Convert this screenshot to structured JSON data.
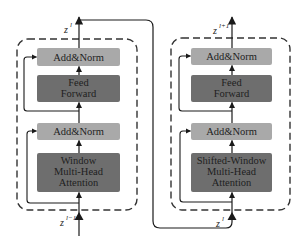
{
  "colors": {
    "light_box": "#a9a9a9",
    "dark_box": "#6e6e6e",
    "line": "#1a1a1a",
    "dashed": "#333333",
    "text": "#1e1e1e"
  },
  "blocks": [
    {
      "name": "swin-block-wmsa",
      "boxes": [
        {
          "label": "Add&Norm",
          "kind": "light"
        },
        {
          "label_lines": [
            "Feed",
            "Forward"
          ],
          "kind": "dark"
        },
        {
          "label": "Add&Norm",
          "kind": "light"
        },
        {
          "label_lines": [
            "Window",
            "Multi-Head",
            "Attention"
          ],
          "kind": "dark"
        }
      ],
      "input_label": {
        "base": "z",
        "sup": "l−1"
      },
      "output_label": {
        "base": "z",
        "sup": "l"
      }
    },
    {
      "name": "swin-block-swmsa",
      "boxes": [
        {
          "label": "Add&Norm",
          "kind": "light"
        },
        {
          "label_lines": [
            "Feed",
            "Forward"
          ],
          "kind": "dark"
        },
        {
          "label": "Add&Norm",
          "kind": "light"
        },
        {
          "label_lines": [
            "Shifted-Window",
            "Multi-Head",
            "Attention"
          ],
          "kind": "dark"
        }
      ],
      "input_label": {
        "base": "z",
        "sup": "l"
      },
      "output_label": {
        "base": "z",
        "sup": "l+1"
      }
    }
  ]
}
